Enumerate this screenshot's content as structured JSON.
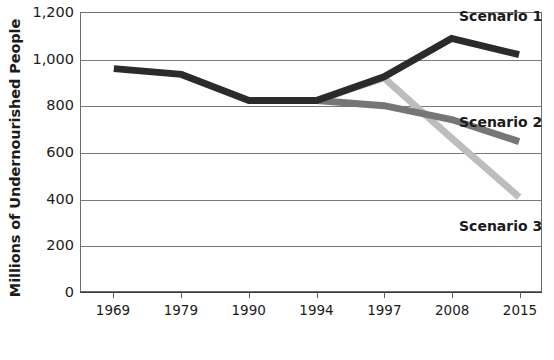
{
  "chart_data": {
    "type": "line",
    "title": "",
    "subtitle": "",
    "xlabel": "",
    "ylabel": "Millions of Undernourished People",
    "categories": [
      "1969",
      "1979",
      "1990",
      "1994",
      "1997",
      "2008",
      "2015"
    ],
    "ylim": [
      0,
      1200
    ],
    "yticks": [
      0,
      200,
      400,
      600,
      800,
      1000,
      1200
    ],
    "ytick_labels": [
      "0",
      "200",
      "400",
      "600",
      "800",
      "1,000",
      "1,200"
    ],
    "grid": true,
    "legend_position": "inline-right",
    "series": [
      {
        "name": "Scenario 1",
        "color": "#2b2b2b",
        "values": [
          960,
          935,
          822,
          822,
          925,
          1090,
          1020
        ]
      },
      {
        "name": "Scenario 2",
        "color": "#767676",
        "values": [
          null,
          null,
          null,
          822,
          800,
          740,
          645
        ]
      },
      {
        "name": "Scenario 3",
        "color": "#bdbdbd",
        "values": [
          null,
          null,
          null,
          822,
          920,
          660,
          405
        ]
      }
    ],
    "annotations": [
      {
        "text": "Scenario 1",
        "x": "2008",
        "y": 1135
      },
      {
        "text": "Scenario 2",
        "x": "2015",
        "y": 745
      },
      {
        "text": "Scenario 3",
        "x": "2015",
        "y": 300
      }
    ]
  },
  "axis": {
    "y_title": "Millions of Undernourished People",
    "y_labels": [
      "1,200",
      "1,000",
      "800",
      "600",
      "400",
      "200",
      "0"
    ],
    "x_labels": [
      "1969",
      "1979",
      "1990",
      "1994",
      "1997",
      "2008",
      "2015"
    ]
  },
  "labels": {
    "scenario1": "Scenario 1",
    "scenario2": "Scenario 2",
    "scenario3": "Scenario 3"
  },
  "colors": {
    "scenario1": "#2b2b2b",
    "scenario2": "#767676",
    "scenario3": "#bdbdbd",
    "grid": "#7a7a7a",
    "axis": "#3a3a3a",
    "text": "#1b1b1b",
    "background": "#ffffff"
  }
}
